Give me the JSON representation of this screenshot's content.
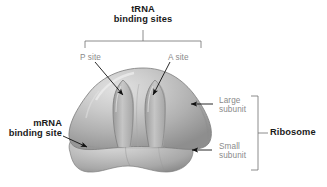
{
  "figure": {
    "width": 327,
    "height": 187,
    "background_color": "#ffffff"
  },
  "labels": {
    "trna_binding_sites": "tRNA\nbinding sites",
    "p_site": "P site",
    "a_site": "A site",
    "large_subunit": "Large\nsubunit",
    "small_subunit": "Small\nsubunit",
    "ribosome": "Ribosome",
    "mrna_binding_site": "mRNA\nbinding site"
  },
  "colors": {
    "bold_text": "#1a1a1a",
    "gray_text": "#8a8a8a",
    "leader_line": "#6e6e6e",
    "bracket": "#6e6e6e",
    "arrow": "#111111",
    "large_subunit_light": "#d8d8d8",
    "large_subunit_mid": "#b4b4b4",
    "large_subunit_dark": "#8d8d8d",
    "small_subunit_light": "#cfcfcf",
    "small_subunit_mid": "#b0b0b0",
    "small_subunit_dark": "#8a8a8a"
  },
  "parts": [
    {
      "name": "large-subunit",
      "label": "Large subunit"
    },
    {
      "name": "small-subunit",
      "label": "Small subunit"
    },
    {
      "name": "p-site-groove",
      "label": "P site"
    },
    {
      "name": "a-site-groove",
      "label": "A site"
    },
    {
      "name": "mrna-binding-site",
      "label": "mRNA binding site"
    }
  ],
  "brackets": [
    {
      "name": "trna-bracket",
      "orientation": "horizontal",
      "label": "tRNA binding sites"
    },
    {
      "name": "ribosome-bracket",
      "orientation": "vertical",
      "label": "Ribosome"
    }
  ]
}
